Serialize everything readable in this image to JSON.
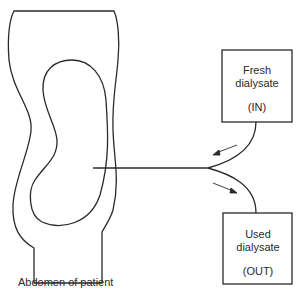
{
  "diagram": {
    "abdomen": {
      "caption": "Abdomen of patient"
    },
    "fresh_box": {
      "line1": "Fresh",
      "line2": "dialysate",
      "line3": "(IN)"
    },
    "used_box": {
      "line1": "Used",
      "line2": "dialysate",
      "line3": "(OUT)"
    },
    "colors": {
      "stroke": "#2a2a2a",
      "background": "#ffffff"
    }
  }
}
